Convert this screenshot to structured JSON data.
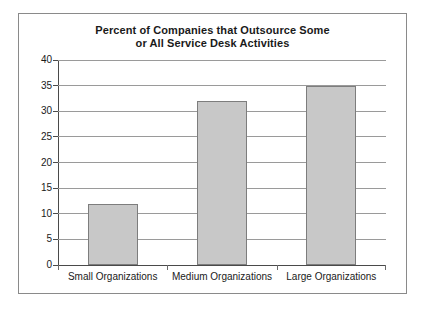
{
  "chart_data": {
    "type": "bar",
    "title": "Percent of Companies that Outsource Some or All Service Desk Activities",
    "title_line1": "Percent of Companies that Outsource Some",
    "title_line2": "or All Service Desk Activities",
    "categories": [
      "Small Organizations",
      "Medium Organizations",
      "Large Organizations"
    ],
    "values": [
      12,
      32,
      35
    ],
    "xlabel": "",
    "ylabel": "",
    "ylim": [
      0,
      40
    ],
    "ytick_step": 5,
    "yticks": [
      0,
      5,
      10,
      15,
      20,
      25,
      30,
      35,
      40
    ],
    "ytick_labels": [
      "0",
      "5",
      "10",
      "15",
      "20",
      "25",
      "30",
      "35",
      "40"
    ],
    "grid": true,
    "grid_axis": "y",
    "legend": false,
    "legend_position": "none",
    "bar_fill_color": "#c8c8c8",
    "bar_border_color": "#7d7d7d",
    "axis_color": "#4a4a4a",
    "gridline_color": "#9a9a9a",
    "frame_border_color": "#8a8a8a",
    "background_color": "#ffffff",
    "text_color": "#1a1a1a"
  }
}
